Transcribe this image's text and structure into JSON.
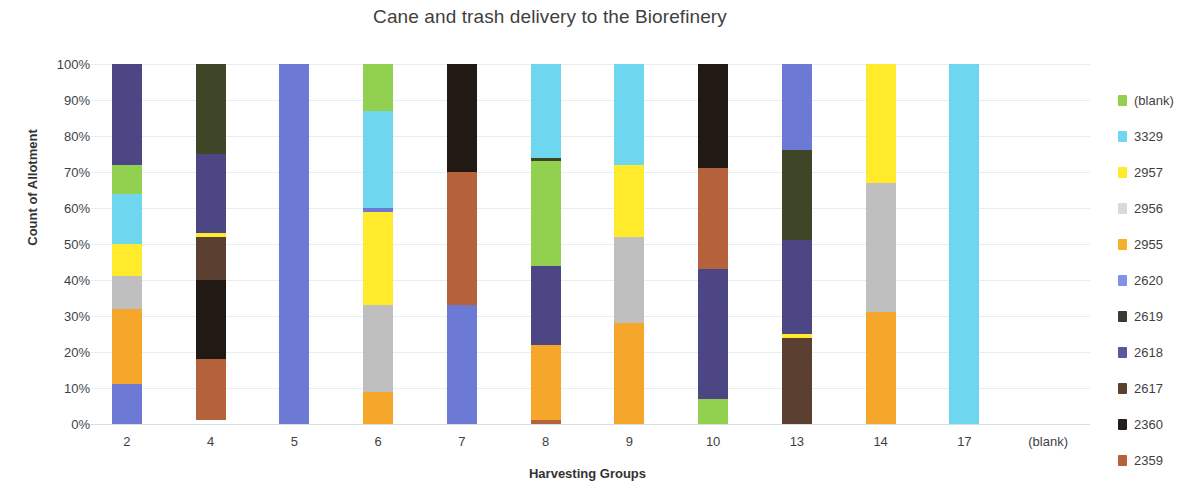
{
  "chart_data": {
    "type": "bar",
    "stacked": true,
    "normalized": "100%",
    "title": "Cane and trash delivery to the Biorefinery",
    "xlabel": "Harvesting Groups",
    "ylabel": "Count of Allotment",
    "ylim": [
      0,
      100
    ],
    "ytick_labels": [
      "0%",
      "10%",
      "20%",
      "30%",
      "40%",
      "50%",
      "60%",
      "70%",
      "80%",
      "90%",
      "100%"
    ],
    "ytick_values": [
      0,
      10,
      20,
      30,
      40,
      50,
      60,
      70,
      80,
      90,
      100
    ],
    "grid": true,
    "legend_position": "right",
    "categories": [
      "2",
      "4",
      "5",
      "6",
      "7",
      "8",
      "9",
      "10",
      "13",
      "14",
      "17",
      "(blank)"
    ],
    "series": [
      {
        "name": "(blank)",
        "color": "#92d050",
        "values": [
          8,
          0,
          0,
          13,
          0,
          30,
          0,
          7,
          0,
          0,
          0,
          0
        ]
      },
      {
        "name": "3329",
        "color": "#6fd6f0",
        "values": [
          14,
          0,
          0,
          27,
          0,
          26,
          28,
          0,
          0,
          0,
          100,
          0
        ]
      },
      {
        "name": "2957",
        "color": "#ffeb2b",
        "values": [
          9,
          1,
          0,
          27,
          0,
          0,
          20,
          0,
          0,
          33,
          0,
          0
        ]
      },
      {
        "name": "2956",
        "color": "#bfbfbf",
        "values": [
          9,
          0,
          0,
          24,
          0,
          0,
          24,
          0,
          0,
          36,
          0,
          0
        ]
      },
      {
        "name": "2955",
        "color": "#f5a72c",
        "values": [
          21,
          0,
          0,
          9,
          0,
          21,
          28,
          0,
          0,
          31,
          0,
          0
        ]
      },
      {
        "name": "2620",
        "color": "#6c7ad6",
        "values": [
          11,
          0,
          100,
          0,
          33,
          0,
          0,
          0,
          24,
          0,
          0,
          0
        ]
      },
      {
        "name": "2619",
        "color": "#3f4527",
        "values": [
          0,
          25,
          0,
          0,
          0,
          0,
          0,
          0,
          25,
          0,
          0,
          0
        ]
      },
      {
        "name": "2618",
        "color": "#4c4685",
        "values": [
          28,
          23,
          0,
          0,
          0,
          22,
          0,
          36,
          26,
          0,
          0,
          0
        ]
      },
      {
        "name": "2617",
        "color": "#5b4032",
        "values": [
          0,
          12,
          0,
          0,
          0,
          0,
          0,
          0,
          25,
          0,
          0,
          0
        ]
      },
      {
        "name": "2360",
        "color": "#211914",
        "values": [
          0,
          22,
          0,
          0,
          30,
          0,
          0,
          29,
          0,
          0,
          0,
          0
        ]
      },
      {
        "name": "2359",
        "color": "#b4613c",
        "values": [
          0,
          17,
          0,
          0,
          37,
          1,
          0,
          28,
          0,
          0,
          0,
          0
        ]
      }
    ],
    "bar_stacks": [
      {
        "category": "2",
        "segments": [
          {
            "series": "2620",
            "from": 0,
            "to": 11
          },
          {
            "series": "2955",
            "from": 11,
            "to": 32
          },
          {
            "series": "2956",
            "from": 32,
            "to": 41
          },
          {
            "series": "2957",
            "from": 41,
            "to": 50
          },
          {
            "series": "3329",
            "from": 50,
            "to": 64
          },
          {
            "series": "(blank)",
            "from": 64,
            "to": 72
          },
          {
            "series": "2618",
            "from": 72,
            "to": 100
          }
        ]
      },
      {
        "category": "4",
        "segments": [
          {
            "series": "2359",
            "from": 1,
            "to": 18
          },
          {
            "series": "2360",
            "from": 18,
            "to": 40
          },
          {
            "series": "2617",
            "from": 40,
            "to": 52
          },
          {
            "series": "2957",
            "from": 52,
            "to": 53
          },
          {
            "series": "2618",
            "from": 53,
            "to": 75
          },
          {
            "series": "2619",
            "from": 75,
            "to": 100
          }
        ]
      },
      {
        "category": "5",
        "segments": [
          {
            "series": "2620",
            "from": 0,
            "to": 100
          }
        ]
      },
      {
        "category": "6",
        "segments": [
          {
            "series": "2955",
            "from": 0,
            "to": 9
          },
          {
            "series": "2956",
            "from": 9,
            "to": 33
          },
          {
            "series": "2957",
            "from": 33,
            "to": 59
          },
          {
            "series": "2620",
            "from": 59,
            "to": 60
          },
          {
            "series": "3329",
            "from": 60,
            "to": 87
          },
          {
            "series": "(blank)",
            "from": 87,
            "to": 100
          }
        ]
      },
      {
        "category": "7",
        "segments": [
          {
            "series": "2620",
            "from": 0,
            "to": 33
          },
          {
            "series": "2359",
            "from": 33,
            "to": 70
          },
          {
            "series": "2360",
            "from": 70,
            "to": 100
          }
        ]
      },
      {
        "category": "8",
        "segments": [
          {
            "series": "2359",
            "from": 0,
            "to": 1
          },
          {
            "series": "2955",
            "from": 1,
            "to": 22
          },
          {
            "series": "2618",
            "from": 22,
            "to": 44
          },
          {
            "series": "(blank)",
            "from": 44,
            "to": 73
          },
          {
            "series": "2619",
            "from": 73,
            "to": 74
          },
          {
            "series": "3329",
            "from": 74,
            "to": 100
          }
        ]
      },
      {
        "category": "9",
        "segments": [
          {
            "series": "2955",
            "from": 0,
            "to": 28
          },
          {
            "series": "2956",
            "from": 28,
            "to": 52
          },
          {
            "series": "2957",
            "from": 52,
            "to": 72
          },
          {
            "series": "3329",
            "from": 72,
            "to": 100
          }
        ]
      },
      {
        "category": "10",
        "segments": [
          {
            "series": "(blank)",
            "from": 0,
            "to": 7
          },
          {
            "series": "2618",
            "from": 7,
            "to": 43
          },
          {
            "series": "2359",
            "from": 43,
            "to": 71
          },
          {
            "series": "2360",
            "from": 71,
            "to": 100
          }
        ]
      },
      {
        "category": "13",
        "segments": [
          {
            "series": "2617",
            "from": 0,
            "to": 24
          },
          {
            "series": "2957",
            "from": 24,
            "to": 25
          },
          {
            "series": "2618",
            "from": 25,
            "to": 51
          },
          {
            "series": "2619",
            "from": 51,
            "to": 76
          },
          {
            "series": "2620",
            "from": 76,
            "to": 100
          }
        ]
      },
      {
        "category": "14",
        "segments": [
          {
            "series": "2955",
            "from": 0,
            "to": 31
          },
          {
            "series": "2956",
            "from": 31,
            "to": 67
          },
          {
            "series": "2957",
            "from": 67,
            "to": 100
          }
        ]
      },
      {
        "category": "17",
        "segments": [
          {
            "series": "3329",
            "from": 0,
            "to": 100
          }
        ]
      },
      {
        "category": "(blank)",
        "segments": []
      }
    ]
  },
  "legend": {
    "items": [
      {
        "label": "(blank)",
        "color": "#92d050"
      },
      {
        "label": "3329",
        "color": "#6fd6f0"
      },
      {
        "label": "2957",
        "color": "#ffeb2b"
      },
      {
        "label": "2956",
        "color": "#d9d9d9"
      },
      {
        "label": "2955",
        "color": "#f5b02c"
      },
      {
        "label": "2620",
        "color": "#8193e8"
      },
      {
        "label": "2619",
        "color": "#3a3a33"
      },
      {
        "label": "2618",
        "color": "#5b56a0"
      },
      {
        "label": "2617",
        "color": "#5b4032"
      },
      {
        "label": "2360",
        "color": "#261d18"
      },
      {
        "label": "2359",
        "color": "#b4613c"
      }
    ]
  }
}
